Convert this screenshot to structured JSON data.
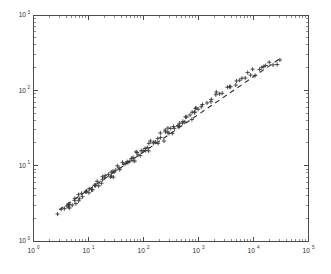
{
  "chart_data": {
    "type": "scatter",
    "title": "",
    "subtitle": "",
    "xlabel": "",
    "ylabel": "",
    "xscale": "log",
    "yscale": "log",
    "xlim": [
      1,
      100000
    ],
    "ylim": [
      1,
      1000
    ],
    "grid": false,
    "legend": null,
    "marker": "+",
    "marker_color": "#3a3a3a",
    "x_tick_labels": [
      "10^0",
      "10^1",
      "10^2",
      "10^3",
      "10^4",
      "10^5"
    ],
    "y_tick_labels": [
      "10^0",
      "10^1",
      "10^2",
      "10^3"
    ],
    "x_tick_mantissas": [
      "1",
      "0",
      "1",
      "2",
      "3",
      "4",
      "5"
    ],
    "x_ticks": [
      1,
      10,
      100,
      1000,
      10000,
      100000
    ],
    "y_ticks": [
      1,
      10,
      100,
      1000
    ],
    "minor_ticks": true,
    "series": [
      {
        "name": "observations",
        "marker": "+",
        "x": [
          3.0,
          3.3,
          3.6,
          3.9,
          4.1,
          4.4,
          4.6,
          4.9,
          5.2,
          5.6,
          6.0,
          6.3,
          6.7,
          7.0,
          7.4,
          7.8,
          8.2,
          8.6,
          9.1,
          9.6,
          10.2,
          10.8,
          11.4,
          12.1,
          12.8,
          13.6,
          14.4,
          15.2,
          16.1,
          17.0,
          18.0,
          19.1,
          20.2,
          21.4,
          22.6,
          24.0,
          25.4,
          26.9,
          28.5,
          30.2,
          32.0,
          33.9,
          35.9,
          38.0,
          40.3,
          42.7,
          45.2,
          47.9,
          50.7,
          53.7,
          56.9,
          60.3,
          63.9,
          67.7,
          71.7,
          75.9,
          80.4,
          85.2,
          90.3,
          95.6,
          101.0,
          107.0,
          114.0,
          121.0,
          128.0,
          136.0,
          144.0,
          152.0,
          161.0,
          171.0,
          181.0,
          192.0,
          203.0,
          215.0,
          228.0,
          241.0,
          256.0,
          271.0,
          287.0,
          304.0,
          322.0,
          341.0,
          362.0,
          383.0,
          406.0,
          430.0,
          456.0,
          483.0,
          512.0,
          542.0,
          574.0,
          608.0,
          645.0,
          683.0,
          724.0,
          767.0,
          813.0,
          861.0,
          912.0,
          966.0,
          1024.0,
          1150.0,
          1290.0,
          1450.0,
          1620.0,
          1820.0,
          2040.0,
          2290.0,
          2570.0,
          2880.0,
          3230.0,
          3630.0,
          4070.0,
          4570.0,
          5130.0,
          5750.0,
          6460.0,
          7240.0,
          8130.0,
          9120.0,
          10200.0,
          11500.0,
          12900.0,
          14500.0,
          16200.0,
          18200.0,
          20400.0,
          22900.0,
          25700.0,
          28800.0
        ],
        "y": [
          2.4,
          2.5,
          2.6,
          2.8,
          2.6,
          2.9,
          3.0,
          3.2,
          3.0,
          3.4,
          3.5,
          3.3,
          3.7,
          3.9,
          3.6,
          4.0,
          4.2,
          4.4,
          4.1,
          4.6,
          4.8,
          4.5,
          5.0,
          5.2,
          5.5,
          5.1,
          5.7,
          6.0,
          5.6,
          6.2,
          6.5,
          6.8,
          6.3,
          7.1,
          7.4,
          7.0,
          7.8,
          8.1,
          7.6,
          8.5,
          8.9,
          8.3,
          9.3,
          9.7,
          9.1,
          10.2,
          10.6,
          11.1,
          10.4,
          11.6,
          12.1,
          11.4,
          12.7,
          13.3,
          12.5,
          13.9,
          14.5,
          15.2,
          14.2,
          15.9,
          16.6,
          15.6,
          17.4,
          18.2,
          17.0,
          19.0,
          19.9,
          20.8,
          19.5,
          21.8,
          22.8,
          21.3,
          23.8,
          24.9,
          23.3,
          26.1,
          27.3,
          28.5,
          26.7,
          29.8,
          31.2,
          29.2,
          32.6,
          34.1,
          31.9,
          35.7,
          37.3,
          39.0,
          36.5,
          40.8,
          42.7,
          39.9,
          44.6,
          46.7,
          43.7,
          48.8,
          51.0,
          53.4,
          49.9,
          55.8,
          58.4,
          62.0,
          66.0,
          70.0,
          74.5,
          79.0,
          84.0,
          89.0,
          94.5,
          100.0,
          106.0,
          112.0,
          119.0,
          126.0,
          134.0,
          141.0,
          149.0,
          157.0,
          166.0,
          175.0,
          185.0,
          172.0,
          194.0,
          205.0,
          190.0,
          215.0,
          226.0,
          210.0,
          237.0,
          248.0
        ]
      }
    ],
    "fit_line": {
      "style": "dashed",
      "color": "#2b2b2b",
      "x": [
        3.0,
        30000.0
      ],
      "y": [
        2.6,
        260.0
      ],
      "slope_loglog": 0.5,
      "description": "dashed power-law reference line through scatter"
    }
  },
  "figure": {
    "background_color": "#ffffff",
    "frame_color": "#4a4a4a",
    "frame_box": true
  }
}
